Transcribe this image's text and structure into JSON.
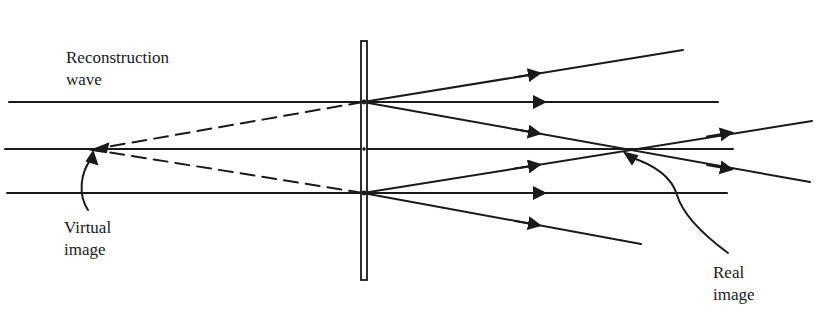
{
  "figure": {
    "colors": {
      "ink": "#1a1a1a",
      "background": "#ffffff"
    }
  },
  "labels": {
    "reconstruction_line1": "Reconstruction",
    "reconstruction_line2": "wave",
    "virtual_line1": "Virtual",
    "virtual_line2": "image",
    "real_line1": "Real",
    "real_line2": "image"
  },
  "geometry": {
    "hologram_plate": {
      "x": 361,
      "y": 41,
      "width": 6,
      "height": 239
    },
    "virtual_image_point": {
      "x": 93,
      "y": 150
    },
    "real_image_point": {
      "x": 623,
      "y": 150
    },
    "incident_rays": [
      {
        "y": 102,
        "x_start": 9,
        "x_end": 718
      },
      {
        "y": 149,
        "x_start": 5,
        "x_end": 733
      },
      {
        "y": 193,
        "x_start": 7,
        "x_end": 727
      }
    ]
  }
}
